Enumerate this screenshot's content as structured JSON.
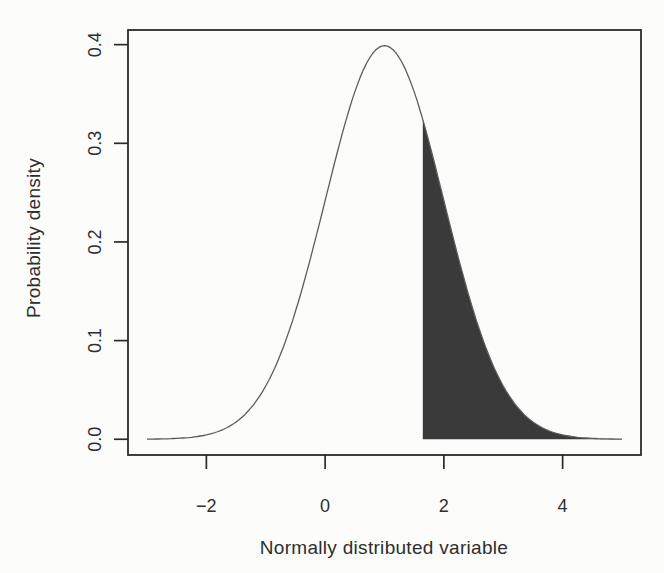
{
  "figure": {
    "background": "#fcfcfb",
    "axis_color": "#2b2b2b",
    "text_color": "#2f2f2f"
  },
  "chart_data": {
    "type": "area",
    "title": "",
    "xlabel": "Normally distributed variable",
    "ylabel": "Probability density",
    "xlim": [
      -3,
      5
    ],
    "ylim": [
      0,
      0.3989
    ],
    "x_ticks": [
      -2,
      0,
      2,
      4
    ],
    "x_tick_labels": [
      "−2",
      "0",
      "2",
      "4"
    ],
    "y_ticks": [
      0,
      0.1,
      0.2,
      0.3,
      0.4
    ],
    "y_tick_labels": [
      "0.0",
      "0.1",
      "0.2",
      "0.3",
      "0.4"
    ],
    "grid": false,
    "legend": null,
    "curve": {
      "distribution": "normal",
      "mean": 1,
      "sd": 1,
      "x_range": [
        -3,
        5
      ],
      "peak": {
        "x": 1,
        "density": 0.3989
      },
      "color": "#5c5c5c"
    },
    "shaded_region": {
      "from": 1.645,
      "to": 5,
      "fill": "#3a3a3a"
    },
    "sample_points": [
      {
        "x": -3.0,
        "density": 0.0001
      },
      {
        "x": -2.5,
        "density": 0.0009
      },
      {
        "x": -2.0,
        "density": 0.0044
      },
      {
        "x": -1.5,
        "density": 0.0175
      },
      {
        "x": -1.0,
        "density": 0.054
      },
      {
        "x": -0.5,
        "density": 0.1295
      },
      {
        "x": 0.0,
        "density": 0.242
      },
      {
        "x": 0.5,
        "density": 0.3521
      },
      {
        "x": 1.0,
        "density": 0.3989
      },
      {
        "x": 1.5,
        "density": 0.3521
      },
      {
        "x": 2.0,
        "density": 0.242
      },
      {
        "x": 2.5,
        "density": 0.1295
      },
      {
        "x": 3.0,
        "density": 0.054
      },
      {
        "x": 3.5,
        "density": 0.0175
      },
      {
        "x": 4.0,
        "density": 0.0044
      },
      {
        "x": 4.5,
        "density": 0.0009
      },
      {
        "x": 5.0,
        "density": 0.0001
      }
    ]
  }
}
